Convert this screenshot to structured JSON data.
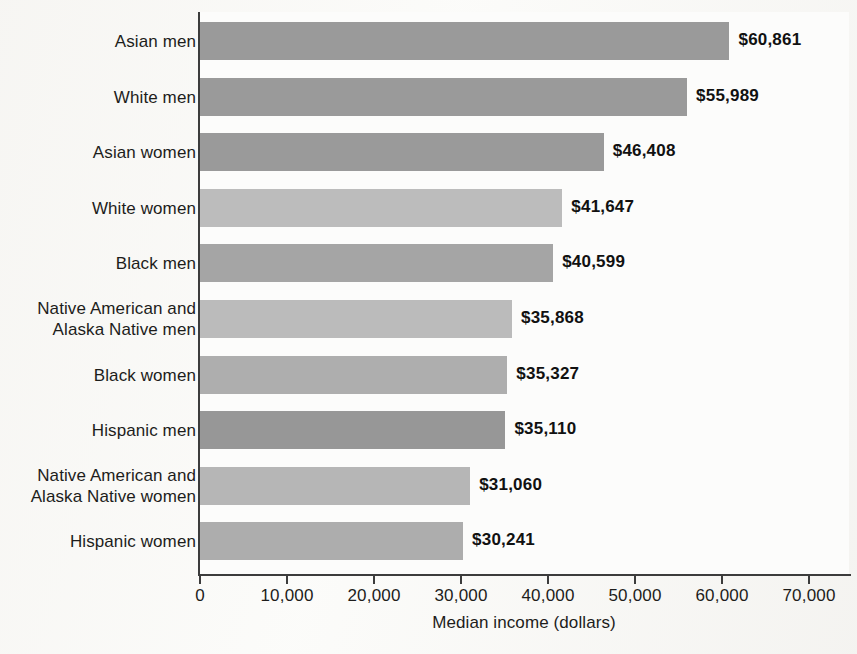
{
  "chart_data": {
    "type": "bar",
    "orientation": "horizontal",
    "title": "",
    "xlabel": "Median income (dollars)",
    "ylabel": "",
    "xlim": [
      0,
      70000
    ],
    "xticks": [
      0,
      10000,
      20000,
      30000,
      40000,
      50000,
      60000,
      70000
    ],
    "xtick_labels": [
      "0",
      "10,000",
      "20,000",
      "30,000",
      "40,000",
      "50,000",
      "60,000",
      "70,000"
    ],
    "grid": false,
    "legend": "none",
    "categories": [
      "Asian men",
      "White men",
      "Asian women",
      "White women",
      "Black men",
      "Native American and Alaska Native men",
      "Black women",
      "Hispanic men",
      "Native American and Alaska Native women",
      "Hispanic women"
    ],
    "values": [
      60861,
      55989,
      46408,
      41647,
      40599,
      35868,
      35327,
      35110,
      31060,
      30241
    ],
    "value_labels": [
      "$60,861",
      "$55,989",
      "$46,408",
      "$41,647",
      "$40,599",
      "$35,868",
      "$35,327",
      "$35,110",
      "$31,060",
      "$30,241"
    ],
    "bar_colors": [
      "#9a9a9a",
      "#9a9a9a",
      "#9a9a9a",
      "#bcbcbc",
      "#a5a5a5",
      "#bbbbbb",
      "#aeaeae",
      "#979797",
      "#b6b6b6",
      "#adadad"
    ],
    "axis_color": "#3c3c3c",
    "text_color": "#1d1d1b"
  },
  "category_lines": [
    [
      "Asian men"
    ],
    [
      "White men"
    ],
    [
      "Asian women"
    ],
    [
      "White women"
    ],
    [
      "Black men"
    ],
    [
      "Native American and",
      "Alaska Native men"
    ],
    [
      "Black women"
    ],
    [
      "Hispanic men"
    ],
    [
      "Native American and",
      "Alaska Native women"
    ],
    [
      "Hispanic women"
    ]
  ]
}
